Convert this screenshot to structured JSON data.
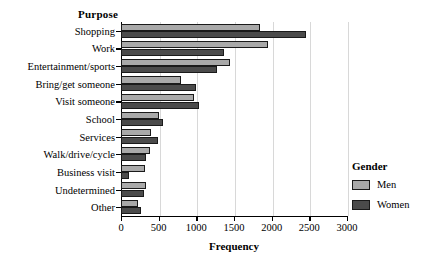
{
  "chart_data": {
    "type": "bar",
    "orientation": "horizontal",
    "title": "",
    "xlabel": "Frequency",
    "ylabel": "Purpose",
    "xlim": [
      0,
      3000
    ],
    "xticks": [
      0,
      500,
      1000,
      1500,
      2000,
      2500,
      3000
    ],
    "grid": true,
    "legend": {
      "title": "Gender",
      "position": "right",
      "entries": [
        {
          "name": "Men",
          "color": "#a9a9a9"
        },
        {
          "name": "Women",
          "color": "#4b4b4b"
        }
      ]
    },
    "categories": [
      "Shopping",
      "Work",
      "Entertainment/sports",
      "Bring/get someone",
      "Visit someone",
      "School",
      "Services",
      "Walk/drive/cycle",
      "Business visit",
      "Undetermined",
      "Other"
    ],
    "series": [
      {
        "name": "Men",
        "color": "#a9a9a9",
        "values": [
          1850,
          1950,
          1450,
          790,
          970,
          500,
          400,
          390,
          320,
          330,
          230
        ]
      },
      {
        "name": "Women",
        "color": "#4b4b4b",
        "values": [
          2450,
          1370,
          1280,
          1000,
          1030,
          560,
          490,
          330,
          100,
          300,
          260
        ]
      }
    ]
  }
}
